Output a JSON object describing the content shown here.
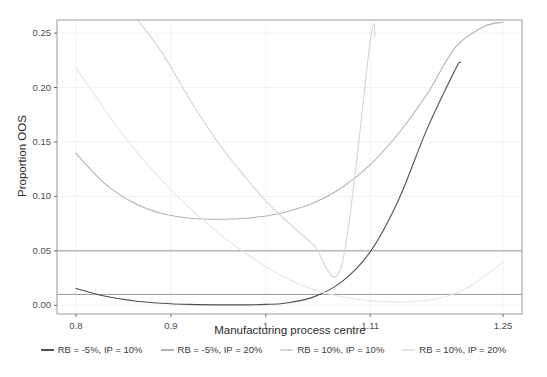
{
  "chart_data": {
    "type": "line",
    "title": "",
    "xlabel": "Manufacturing process centre",
    "ylabel": "Proportion OOS",
    "xlim": [
      0.78,
      1.27
    ],
    "ylim": [
      -0.008,
      0.262
    ],
    "xticks": [
      "0.8",
      "0.9",
      "1",
      "1.11",
      "1.25"
    ],
    "xtick_values": [
      0.8,
      0.9,
      1.0,
      1.11,
      1.25
    ],
    "yticks": [
      "0.00",
      "0.05",
      "0.10",
      "0.15",
      "0.20",
      "0.25"
    ],
    "ytick_values": [
      0.0,
      0.05,
      0.1,
      0.15,
      0.2,
      0.25
    ],
    "grid": true,
    "legend_position": "bottom",
    "reference_lines": [
      {
        "name": "oos-threshold-5pct",
        "y": 0.05,
        "color": "#8c8c8c"
      },
      {
        "name": "oos-threshold-1pct",
        "y": 0.01,
        "color": "#8c8c8c"
      }
    ],
    "series": [
      {
        "name": "RB = -5%, IP = 10%",
        "color": "#4f4f4f",
        "x": [
          0.8,
          0.83,
          0.86,
          0.89,
          0.92,
          0.95,
          0.98,
          1.0,
          1.02,
          1.05,
          1.08,
          1.11,
          1.14,
          1.17,
          1.2,
          1.205
        ],
        "y": [
          0.0155,
          0.0085,
          0.0042,
          0.0019,
          0.0008,
          0.0004,
          0.0004,
          0.0008,
          0.0019,
          0.0075,
          0.0215,
          0.049,
          0.097,
          0.162,
          0.217,
          0.223
        ]
      },
      {
        "name": "RB = -5%, IP = 20%",
        "color": "#b3b3b3",
        "x": [
          0.8,
          0.83,
          0.86,
          0.89,
          0.92,
          0.95,
          0.98,
          1.0,
          1.02,
          1.05,
          1.08,
          1.11,
          1.14,
          1.17,
          1.2,
          1.23,
          1.25
        ],
        "y": [
          0.1395,
          0.112,
          0.0945,
          0.0845,
          0.08,
          0.079,
          0.08,
          0.082,
          0.0855,
          0.094,
          0.108,
          0.129,
          0.158,
          0.194,
          0.237,
          0.256,
          0.26
        ]
      },
      {
        "name": "RB = 10%, IP = 10%",
        "color": "#d4d4d4",
        "x": [
          0.865,
          0.89,
          0.92,
          0.95,
          0.98,
          1.0,
          1.02,
          1.05,
          1.08,
          1.11,
          1.115
        ],
        "y": [
          0.262,
          0.233,
          0.189,
          0.149,
          0.116,
          0.096,
          0.079,
          0.056,
          0.037,
          0.242,
          0.247
        ]
      },
      {
        "name": "RB = 10%, IP = 20%",
        "color": "#e6e6e6",
        "x": [
          0.8,
          0.85,
          0.9,
          0.95,
          1.0,
          1.03,
          1.06,
          1.09,
          1.12,
          1.15,
          1.18,
          1.21,
          1.24,
          1.25
        ],
        "y": [
          0.218,
          0.156,
          0.106,
          0.0665,
          0.0355,
          0.0215,
          0.012,
          0.0062,
          0.0036,
          0.003,
          0.006,
          0.015,
          0.033,
          0.04
        ]
      }
    ]
  },
  "legend": {
    "items": [
      {
        "label": "RB = -5%, IP = 10%",
        "color": "#4f4f4f"
      },
      {
        "label": "RB = -5%, IP = 20%",
        "color": "#b3b3b3"
      },
      {
        "label": "RB = 10%, IP = 10%",
        "color": "#d4d4d4"
      },
      {
        "label": "RB = 10%, IP = 20%",
        "color": "#e6e6e6"
      }
    ]
  },
  "panel": {
    "border_color": "#9a9a9a",
    "background": "#ffffff",
    "gridline_color": "#f2f2f2"
  }
}
